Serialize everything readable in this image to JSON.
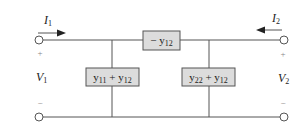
{
  "diagram": {
    "type": "two-port pi-equivalent circuit",
    "currents": {
      "left": {
        "label": "I",
        "sub": "1",
        "direction": "right"
      },
      "right": {
        "label": "I",
        "sub": "2",
        "direction": "left"
      }
    },
    "voltages": {
      "left": {
        "label": "V",
        "sub": "1",
        "plus": "+",
        "minus": "−"
      },
      "right": {
        "label": "V",
        "sub": "2",
        "plus": "+",
        "minus": "−"
      }
    },
    "elements": {
      "series": {
        "text": "− y",
        "sub": "12"
      },
      "shunt_left": {
        "a": "y",
        "a_sub": "11",
        "op": " + ",
        "b": "y",
        "b_sub": "12"
      },
      "shunt_right": {
        "a": "y",
        "a_sub": "22",
        "op": " + ",
        "b": "y",
        "b_sub": "12"
      }
    },
    "colors": {
      "wire": "#555555",
      "box_fill": "#dcdcdc",
      "text": "#222222"
    }
  }
}
